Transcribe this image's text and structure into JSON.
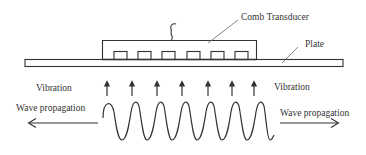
{
  "diagram": {
    "labels": {
      "comb_transducer": "Comb Transducer",
      "plate": "Plate",
      "vibration_left": "Vibration",
      "vibration_right": "Vibration",
      "wave_propagation_left": "Wave propagation",
      "wave_propagation_right": "Wave propagation"
    },
    "vibration_arrow_count": 7,
    "comb_teeth_count": 6,
    "wave_cycles": 7,
    "colors": {
      "stroke": "#333333",
      "background": "#ffffff"
    }
  }
}
